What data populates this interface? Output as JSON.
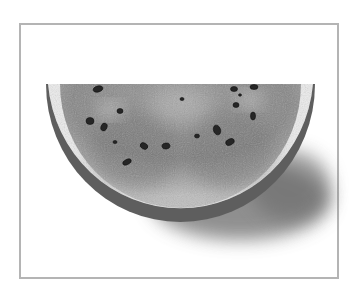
{
  "image": {
    "subject": "Watermelon slice",
    "description": "Grayscale photo of a half-moon watermelon slice with seeds, casting a soft shadow, inside a thin gray frame",
    "seed_count": 17,
    "colors": {
      "background": "#ffffff",
      "frame": "#b4b4b4",
      "flesh": "#8a8a8a",
      "flesh_dark": "#6e6e6e",
      "rind_inner": "#e6e6e6",
      "rind_outer": "#5a5a5a",
      "seed": "#2a2a2a",
      "shadow": "#7a7a7a"
    }
  }
}
